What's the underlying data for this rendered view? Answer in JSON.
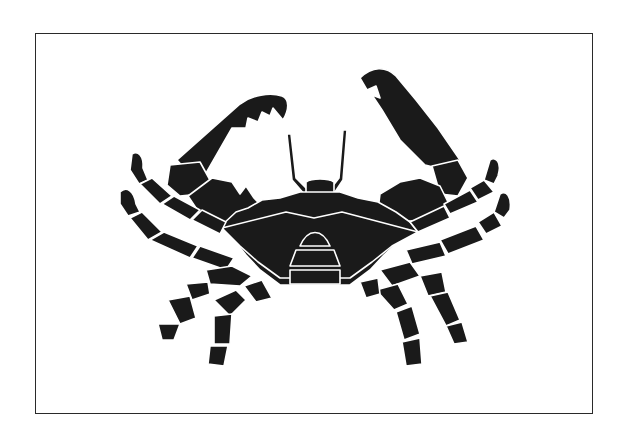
{
  "image": {
    "subject": "crab silhouette",
    "description": "Black silhouette illustration of a crab with raised claws inside a thin rectangular border",
    "colors": {
      "background": "#ffffff",
      "silhouette": "#1a1a1a",
      "frame": "#2a2a2a",
      "highlight": "#ffffff"
    }
  }
}
